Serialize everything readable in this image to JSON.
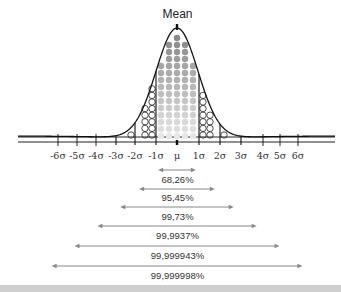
{
  "chart_data": {
    "type": "area",
    "title": "Mean",
    "subtitle": "Normal distribution with standard deviation ranges",
    "xlabel": "",
    "ylabel": "",
    "x_ticks": [
      "-6σ",
      "-5σ",
      "-4σ",
      "-3σ",
      "-2σ",
      "-1σ",
      "μ",
      "1σ",
      "2σ",
      "3σ",
      "4σ",
      "5σ",
      "6σ"
    ],
    "x_tick_pixels": [
      58,
      77,
      96,
      116,
      135,
      156,
      177,
      199,
      220,
      241,
      263,
      280,
      298
    ],
    "grid": false,
    "ranges": [
      {
        "sigma": 1,
        "label": "68,26%",
        "value": 68.26
      },
      {
        "sigma": 2,
        "label": "95,45%",
        "value": 95.45
      },
      {
        "sigma": 3,
        "label": "99,73%",
        "value": 99.73
      },
      {
        "sigma": 4,
        "label": "99,9937%",
        "value": 99.9937
      },
      {
        "sigma": 5,
        "label": "99,999943%",
        "value": 99.999943
      },
      {
        "sigma": 6,
        "label": "99,999998%",
        "value": 99.999998
      }
    ],
    "fill": {
      "within_1_sigma": "filled gray dots (gradient dark top to light bottom)",
      "1_to_3_sigma": "hollow circles"
    },
    "annotations": [
      "Mean"
    ]
  },
  "colors": {
    "curve": "#111111",
    "dot_dark": "#8a8a8a",
    "dot_light": "#e6e6e6",
    "arrow": "#888888",
    "band": "#cfcfcf"
  }
}
